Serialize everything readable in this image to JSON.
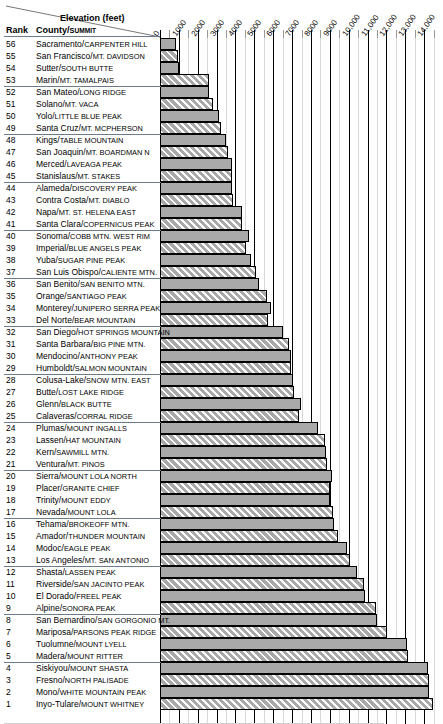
{
  "header": {
    "axis_title": "Elevation (feet)",
    "rank_header": "Rank",
    "county_header": "County/Summit"
  },
  "chart_data": {
    "type": "bar",
    "orientation": "horizontal",
    "title": "Elevation (feet)",
    "xlabel": "Elevation (feet)",
    "ylabel": "Rank  County/Summit",
    "xlim": [
      0,
      15000
    ],
    "grid": true,
    "legend": "none",
    "tick_labels": [
      "0",
      "1000",
      "2000",
      "3000",
      "4000",
      "5000",
      "6000",
      "7000",
      "8000",
      "9000",
      "10,000",
      "11,000",
      "12,000",
      "13,000",
      "14,000"
    ],
    "tick_values": [
      0,
      1000,
      2000,
      3000,
      4000,
      5000,
      6000,
      7000,
      8000,
      9000,
      10000,
      11000,
      12000,
      13000,
      14000
    ],
    "categories": [
      "Sacramento/Carpenter Hill",
      "San Francisco/Mt. Davidson",
      "Sutter/South Butte",
      "Marin/Mt. Tamalpais",
      "San Mateo/Long Ridge",
      "Solano/Mt. Vaca",
      "Yolo/Little Blue Peak",
      "Santa Cruz/Mt. McPherson",
      "Kings/Table Mountain",
      "San Joaquin/Mt. Boardman N",
      "Merced/Laveaga Peak",
      "Stanislaus/Mt. Stakes",
      "Alameda/Discovery Peak",
      "Contra Costa/Mt. Diablo",
      "Napa/Mt. St. Helena East",
      "Santa Clara/Copernicus Peak",
      "Sonoma/Cobb Mtn. West Rim",
      "Imperial/Blue Angels Peak",
      "Yuba/Sugar Pine Peak",
      "San Luis Obispo/Caliente Mtn.",
      "San Benito/San Benito Mtn.",
      "Orange/Santiago Peak",
      "Monterey/Junipero Serra Peak",
      "Del Norte/Bear Mountain",
      "San Diego/Hot Springs Mountain",
      "Santa Barbara/Big Pine Mtn.",
      "Mendocino/Anthony Peak",
      "Humboldt/Salmon Mountain",
      "Colusa-Lake/Snow Mtn. East",
      "Butte/Lost Lake Ridge",
      "Glenn/Black Butte",
      "Calaveras/Corral Ridge",
      "Plumas/Mount Ingalls",
      "Lassen/Hat Mountain",
      "Kern/Sawmill Mtn.",
      "Ventura/Mt. Pinos",
      "Sierra/Mount Lola North",
      "Placer/Granite Chief",
      "Trinity/Mount Eddy",
      "Nevada/Mount Lola",
      "Tehama/Brokeoff Mtn.",
      "Amador/Thunder Mountain",
      "Modoc/Eagle Peak",
      "Los Angeles/Mt. San Antonio",
      "Shasta/Lassen Peak",
      "Riverside/San Jacinto Peak",
      "El Dorado/Freel Peak",
      "Alpine/Sonora Peak",
      "San Bernardino/San Gorgonio Mt.",
      "Mariposa/Parsons Peak Ridge",
      "Tuolumne/Mount Lyell",
      "Madera/Mount Ritter",
      "Siskiyou/Mount Shasta",
      "Fresno/North Palisade",
      "Mono/White Mountain Peak",
      "Inyo-Tulare/Mount Whitney"
    ],
    "values": [
      830,
      928,
      1004,
      2571,
      2600,
      2819,
      3110,
      3231,
      3473,
      3626,
      3801,
      3804,
      3841,
      3849,
      4343,
      4360,
      4722,
      4548,
      4800,
      5106,
      5241,
      5687,
      5862,
      5744,
      6533,
      6828,
      6954,
      6956,
      7056,
      7120,
      7448,
      7369,
      8372,
      8737,
      8818,
      8831,
      9143,
      9006,
      9025,
      9148,
      9235,
      9410,
      9892,
      10064,
      10457,
      10834,
      10881,
      11462,
      11503,
      12040,
      13114,
      13143,
      14179,
      14242,
      14252,
      14494
    ],
    "rows": [
      {
        "rank": "56",
        "county": "Sacramento",
        "summit": "Carpenter Hill",
        "value": 830
      },
      {
        "rank": "55",
        "county": "San Francisco",
        "summit": "Mt. Davidson",
        "value": 928
      },
      {
        "rank": "54",
        "county": "Sutter",
        "summit": "South Butte",
        "value": 1004
      },
      {
        "rank": "53",
        "county": "Marin",
        "summit": "Mt. Tamalpais",
        "value": 2571
      },
      {
        "rank": "52",
        "county": "San Mateo",
        "summit": "Long Ridge",
        "value": 2600
      },
      {
        "rank": "51",
        "county": "Solano",
        "summit": "Mt. Vaca",
        "value": 2819
      },
      {
        "rank": "50",
        "county": "Yolo",
        "summit": "Little Blue Peak",
        "value": 3110
      },
      {
        "rank": "49",
        "county": "Santa Cruz",
        "summit": "Mt. McPherson",
        "value": 3231
      },
      {
        "rank": "48",
        "county": "Kings",
        "summit": "Table Mountain",
        "value": 3473
      },
      {
        "rank": "47",
        "county": "San Joaquin",
        "summit": "Mt. Boardman N",
        "value": 3626
      },
      {
        "rank": "46",
        "county": "Merced",
        "summit": "Laveaga Peak",
        "value": 3801
      },
      {
        "rank": "45",
        "county": "Stanislaus",
        "summit": "Mt. Stakes",
        "value": 3804
      },
      {
        "rank": "44",
        "county": "Alameda",
        "summit": "Discovery Peak",
        "value": 3841
      },
      {
        "rank": "43",
        "county": "Contra Costa",
        "summit": "Mt. Diablo",
        "value": 3849
      },
      {
        "rank": "42",
        "county": "Napa",
        "summit": "Mt. St. Helena East",
        "value": 4343
      },
      {
        "rank": "41",
        "county": "Santa Clara",
        "summit": "Copernicus Peak",
        "value": 4360
      },
      {
        "rank": "40",
        "county": "Sonoma",
        "summit": "Cobb Mtn. West Rim",
        "value": 4722
      },
      {
        "rank": "39",
        "county": "Imperial",
        "summit": "Blue Angels Peak",
        "value": 4548
      },
      {
        "rank": "38",
        "county": "Yuba",
        "summit": "Sugar Pine Peak",
        "value": 4800
      },
      {
        "rank": "37",
        "county": "San Luis Obispo",
        "summit": "Caliente Mtn.",
        "value": 5106
      },
      {
        "rank": "36",
        "county": "San Benito",
        "summit": "San Benito Mtn.",
        "value": 5241
      },
      {
        "rank": "35",
        "county": "Orange",
        "summit": "Santiago Peak",
        "value": 5687
      },
      {
        "rank": "34",
        "county": "Monterey",
        "summit": "Junipero Serra Peak",
        "value": 5862
      },
      {
        "rank": "33",
        "county": "Del Norte",
        "summit": "Bear Mountain",
        "value": 5744
      },
      {
        "rank": "32",
        "county": "San Diego",
        "summit": "Hot Springs Mountain",
        "value": 6533
      },
      {
        "rank": "31",
        "county": "Santa Barbara",
        "summit": "Big Pine Mtn.",
        "value": 6828
      },
      {
        "rank": "30",
        "county": "Mendocino",
        "summit": "Anthony Peak",
        "value": 6954
      },
      {
        "rank": "29",
        "county": "Humboldt",
        "summit": "Salmon Mountain",
        "value": 6956
      },
      {
        "rank": "28",
        "county": "Colusa-Lake",
        "summit": "Snow Mtn. East",
        "value": 7056
      },
      {
        "rank": "27",
        "county": "Butte",
        "summit": "Lost Lake Ridge",
        "value": 7120
      },
      {
        "rank": "26",
        "county": "Glenn",
        "summit": "Black Butte",
        "value": 7448
      },
      {
        "rank": "25",
        "county": "Calaveras",
        "summit": "Corral Ridge",
        "value": 7369
      },
      {
        "rank": "24",
        "county": "Plumas",
        "summit": "Mount Ingalls",
        "value": 8372
      },
      {
        "rank": "23",
        "county": "Lassen",
        "summit": "Hat Mountain",
        "value": 8737
      },
      {
        "rank": "22",
        "county": "Kern",
        "summit": "Sawmill Mtn.",
        "value": 8818
      },
      {
        "rank": "21",
        "county": "Ventura",
        "summit": "Mt. Pinos",
        "value": 8831
      },
      {
        "rank": "20",
        "county": "Sierra",
        "summit": "Mount Lola North",
        "value": 9143
      },
      {
        "rank": "19",
        "county": "Placer",
        "summit": "Granite Chief",
        "value": 9006
      },
      {
        "rank": "18",
        "county": "Trinity",
        "summit": "Mount Eddy",
        "value": 9025
      },
      {
        "rank": "17",
        "county": "Nevada",
        "summit": "Mount Lola",
        "value": 9148
      },
      {
        "rank": "16",
        "county": "Tehama",
        "summit": "Brokeoff Mtn.",
        "value": 9235
      },
      {
        "rank": "15",
        "county": "Amador",
        "summit": "Thunder Mountain",
        "value": 9410
      },
      {
        "rank": "14",
        "county": "Modoc",
        "summit": "Eagle Peak",
        "value": 9892
      },
      {
        "rank": "13",
        "county": "Los Angeles",
        "summit": "Mt. San Antonio",
        "value": 10064
      },
      {
        "rank": "12",
        "county": "Shasta",
        "summit": "Lassen Peak",
        "value": 10457
      },
      {
        "rank": "11",
        "county": "Riverside",
        "summit": "San Jacinto Peak",
        "value": 10834
      },
      {
        "rank": "10",
        "county": "El Dorado",
        "summit": "Freel Peak",
        "value": 10881
      },
      {
        "rank": "9",
        "county": "Alpine",
        "summit": "Sonora Peak",
        "value": 11462
      },
      {
        "rank": "8",
        "county": "San Bernardino",
        "summit": "San Gorgonio Mt.",
        "value": 11503
      },
      {
        "rank": "7",
        "county": "Mariposa",
        "summit": "Parsons Peak Ridge",
        "value": 12040
      },
      {
        "rank": "6",
        "county": "Tuolumne",
        "summit": "Mount Lyell",
        "value": 13114
      },
      {
        "rank": "5",
        "county": "Madera",
        "summit": "Mount Ritter",
        "value": 13143
      },
      {
        "rank": "4",
        "county": "Siskiyou",
        "summit": "Mount Shasta",
        "value": 14179
      },
      {
        "rank": "3",
        "county": "Fresno",
        "summit": "North Palisade",
        "value": 14242
      },
      {
        "rank": "2",
        "county": "Mono",
        "summit": "White Mountain Peak",
        "value": 14252
      },
      {
        "rank": "1",
        "county": "Inyo-Tulare",
        "summit": "Mount Whitney",
        "value": 14494
      }
    ]
  },
  "style": {
    "bar_fill": "#a9a9a9",
    "bar_border": "#000000",
    "rule_color": "#6c7a91",
    "gridline_major": "#000000",
    "gridline_minor": "#d8d8d8"
  }
}
